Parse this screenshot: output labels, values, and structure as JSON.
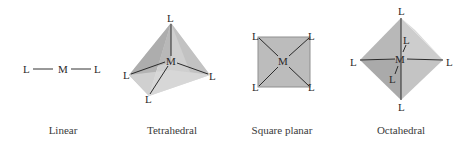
{
  "figure": {
    "geometries": [
      {
        "name": "Linear",
        "caption": "Linear",
        "center_label": "M",
        "ligand_label": "L",
        "ligand_count": 2
      },
      {
        "name": "Tetrahedral",
        "caption": "Tetrahedral",
        "center_label": "M",
        "ligand_label": "L",
        "ligand_count": 4
      },
      {
        "name": "Square planar",
        "caption": "Square planar",
        "center_label": "M",
        "ligand_label": "L",
        "ligand_count": 4
      },
      {
        "name": "Octahedral",
        "caption": "Octahedral",
        "center_label": "M",
        "ligand_label": "L",
        "ligand_count": 6
      }
    ],
    "colors": {
      "face_light": "#d6d6d6",
      "face_mid": "#bdbdbd",
      "face_dark": "#a8a8a8",
      "square_fill": "#bcbcbc",
      "bond": "#2b2b2b"
    }
  }
}
